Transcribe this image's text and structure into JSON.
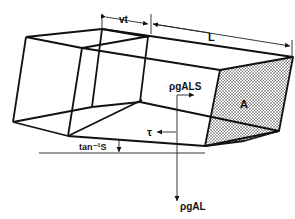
{
  "diagram": {
    "type": "physics-schematic",
    "labels": {
      "vt": "vt",
      "L": "L",
      "rho_g_A_L_S": "ρgALS",
      "A": "A",
      "tau": "τ",
      "tan_inv_S": "tan⁻¹S",
      "rho_g_A_L": "ρgAL"
    },
    "dimensions": [
      {
        "name": "vt",
        "meaning": "displacement of element in time t"
      },
      {
        "name": "L",
        "meaning": "length of element"
      }
    ],
    "forces": [
      {
        "name": "ρgALS",
        "direction": "downslope (rightward arrow)"
      },
      {
        "name": "τ",
        "direction": "resisting shear (leftward arrow)"
      },
      {
        "name": "ρgAL",
        "direction": "weight (downward arrow)"
      }
    ],
    "angle": {
      "label": "tan⁻¹S",
      "meaning": "slope angle relative to horizontal"
    },
    "shaded_face": {
      "label": "A",
      "pattern": "stippled",
      "meaning": "cross-sectional area"
    },
    "colors": {
      "ink": "#111111",
      "background": "#ffffff",
      "stipple": "#333333"
    }
  }
}
